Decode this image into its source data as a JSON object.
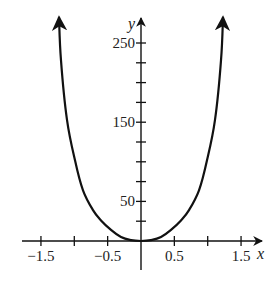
{
  "chart_data": {
    "type": "line",
    "title": "",
    "xlabel": "x",
    "ylabel": "y",
    "xlim": [
      -1.75,
      1.75
    ],
    "ylim": [
      -25,
      290
    ],
    "grid": false,
    "legend": null,
    "x_ticks": [
      -1.5,
      -1.0,
      -0.5,
      0.5,
      1.0,
      1.5
    ],
    "x_tick_labels": [
      "-1.5",
      "-0.5",
      "0.5",
      "1.5"
    ],
    "x_tick_label_values": [
      -1.5,
      -0.5,
      0.5,
      1.5
    ],
    "y_ticks": [
      25,
      50,
      75,
      100,
      125,
      150,
      175,
      200,
      225,
      250
    ],
    "y_tick_labels": [
      "50",
      "150",
      "250"
    ],
    "y_tick_label_values": [
      50,
      150,
      250
    ],
    "series": [
      {
        "name": "curve",
        "description": "Even quartic-like curve, minimum at origin, arrows at both ends",
        "x": [
          -1.23,
          -1.2,
          -1.11,
          -0.99,
          -0.87,
          -0.72,
          -0.6,
          -0.45,
          -0.3,
          -0.15,
          0,
          0.15,
          0.3,
          0.45,
          0.6,
          0.72,
          0.87,
          0.99,
          1.11,
          1.2,
          1.23
        ],
        "y": [
          283,
          228,
          153,
          102,
          64,
          39,
          26,
          14,
          5,
          1,
          0,
          1,
          5,
          14,
          26,
          39,
          64,
          102,
          153,
          228,
          283
        ]
      }
    ]
  }
}
